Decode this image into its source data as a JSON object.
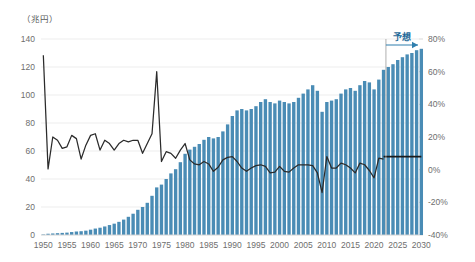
{
  "chart_data": {
    "type": "bar",
    "title": "",
    "subtitle": "",
    "left_unit_label": "（兆円）",
    "right_unit_label": "",
    "xlabel": "",
    "ylabel": "",
    "legend_position": "none",
    "grid": true,
    "left_axis": {
      "label": "（兆円）",
      "ticks": [
        "0",
        "20",
        "40",
        "60",
        "80",
        "100",
        "120",
        "140"
      ],
      "ylim": [
        0,
        140
      ]
    },
    "right_axis": {
      "ticks": [
        "-40%",
        "-20%",
        "0%",
        "20%",
        "40%",
        "60%",
        "80%"
      ],
      "ylim": [
        -40,
        80
      ]
    },
    "x_tick_labels": [
      "1950",
      "1955",
      "1960",
      "1965",
      "1970",
      "1975",
      "1980",
      "1985",
      "1990",
      "1995",
      "2000",
      "2005",
      "2010",
      "2015",
      "2020",
      "2025",
      "2030"
    ],
    "x_range": [
      1950,
      2030
    ],
    "annotations": [
      {
        "name": "forecast-label",
        "text": "予想",
        "start_year": 2023,
        "end_year": 2030
      }
    ],
    "colors": {
      "bar": "#4a8cb5",
      "line": "#2b2b2b",
      "forecast_accent": "#2f7fae",
      "gridline": "#e8e8e8",
      "axis_text": "#6e6e6e"
    },
    "series": [
      {
        "name": "金額（兆円）",
        "axis": "left",
        "type": "bar",
        "x": [
          1950,
          1951,
          1952,
          1953,
          1954,
          1955,
          1956,
          1957,
          1958,
          1959,
          1960,
          1961,
          1962,
          1963,
          1964,
          1965,
          1966,
          1967,
          1968,
          1969,
          1970,
          1971,
          1972,
          1973,
          1974,
          1975,
          1976,
          1977,
          1978,
          1979,
          1980,
          1981,
          1982,
          1983,
          1984,
          1985,
          1986,
          1987,
          1988,
          1989,
          1990,
          1991,
          1992,
          1993,
          1994,
          1995,
          1996,
          1997,
          1998,
          1999,
          2000,
          2001,
          2002,
          2003,
          2004,
          2005,
          2006,
          2007,
          2008,
          2009,
          2010,
          2011,
          2012,
          2013,
          2014,
          2015,
          2016,
          2017,
          2018,
          2019,
          2020,
          2021,
          2022,
          2023,
          2024,
          2025,
          2026,
          2027,
          2028,
          2029,
          2030
        ],
        "values": [
          0.4,
          0.9,
          1.1,
          1.3,
          1.5,
          1.7,
          2.1,
          2.5,
          2.7,
          3.1,
          3.8,
          4.6,
          5.2,
          6.1,
          7.1,
          8.1,
          9.4,
          11.0,
          13.0,
          15.2,
          18.0,
          20.0,
          23.0,
          28.0,
          34.0,
          36.0,
          40.0,
          44.0,
          47.0,
          52.0,
          58.0,
          61.0,
          63.0,
          65.0,
          68.0,
          70.0,
          69.0,
          70.0,
          74.0,
          79.0,
          85.0,
          89.0,
          90.0,
          89.0,
          90.0,
          92.0,
          95.0,
          97.0,
          95.0,
          94.0,
          96.0,
          95.0,
          94.0,
          95.0,
          98.0,
          101.0,
          104.0,
          107.0,
          103.0,
          88.0,
          95.0,
          96.0,
          97.0,
          101.0,
          104.0,
          105.0,
          103.0,
          107.0,
          110.0,
          109.0,
          104.0,
          111.0,
          118.0,
          120.0,
          122.0,
          125.0,
          127.0,
          129.0,
          130.0,
          132.0,
          133.0
        ]
      },
      {
        "name": "前年比伸び率（%）",
        "axis": "right",
        "type": "line",
        "x": [
          1950,
          1951,
          1952,
          1953,
          1954,
          1955,
          1956,
          1957,
          1958,
          1959,
          1960,
          1961,
          1962,
          1963,
          1964,
          1965,
          1966,
          1967,
          1968,
          1969,
          1970,
          1971,
          1972,
          1973,
          1974,
          1975,
          1976,
          1977,
          1978,
          1979,
          1980,
          1981,
          1982,
          1983,
          1984,
          1985,
          1986,
          1987,
          1988,
          1989,
          1990,
          1991,
          1992,
          1993,
          1994,
          1995,
          1996,
          1997,
          1998,
          1999,
          2000,
          2001,
          2002,
          2003,
          2004,
          2005,
          2006,
          2007,
          2008,
          2009,
          2010,
          2011,
          2012,
          2013,
          2014,
          2015,
          2016,
          2017,
          2018,
          2019,
          2020,
          2021,
          2022
        ],
        "values": [
          70.0,
          0.5,
          20.0,
          18.0,
          13.0,
          14.0,
          21.0,
          19.0,
          6.5,
          15.0,
          21.0,
          22.0,
          12.0,
          18.0,
          16.0,
          12.0,
          16.0,
          18.0,
          17.0,
          18.0,
          18.0,
          10.0,
          16.0,
          22.0,
          60.0,
          5.0,
          11.0,
          10.0,
          7.0,
          12.0,
          16.0,
          6.0,
          3.5,
          3.0,
          5.0,
          3.5,
          -1.0,
          1.5,
          6.0,
          7.5,
          8.0,
          5.0,
          1.0,
          -1.0,
          1.0,
          2.5,
          3.0,
          2.0,
          -2.0,
          -1.5,
          2.0,
          -1.0,
          -1.5,
          1.0,
          3.0,
          3.0,
          3.0,
          2.5,
          -2.0,
          -14.0,
          8.0,
          1.0,
          1.0,
          4.0,
          3.0,
          1.0,
          -2.0,
          4.0,
          3.0,
          -0.5,
          -5.0,
          7.0,
          6.5
        ]
      },
      {
        "name": "前年比伸び率（予想）",
        "axis": "right",
        "type": "line",
        "forecast": true,
        "x": [
          2022,
          2023,
          2024,
          2025,
          2026,
          2027,
          2028,
          2029,
          2030
        ],
        "values": [
          8.0,
          8.0,
          8.0,
          8.0,
          8.0,
          8.0,
          8.0,
          8.0,
          8.0
        ]
      }
    ]
  }
}
